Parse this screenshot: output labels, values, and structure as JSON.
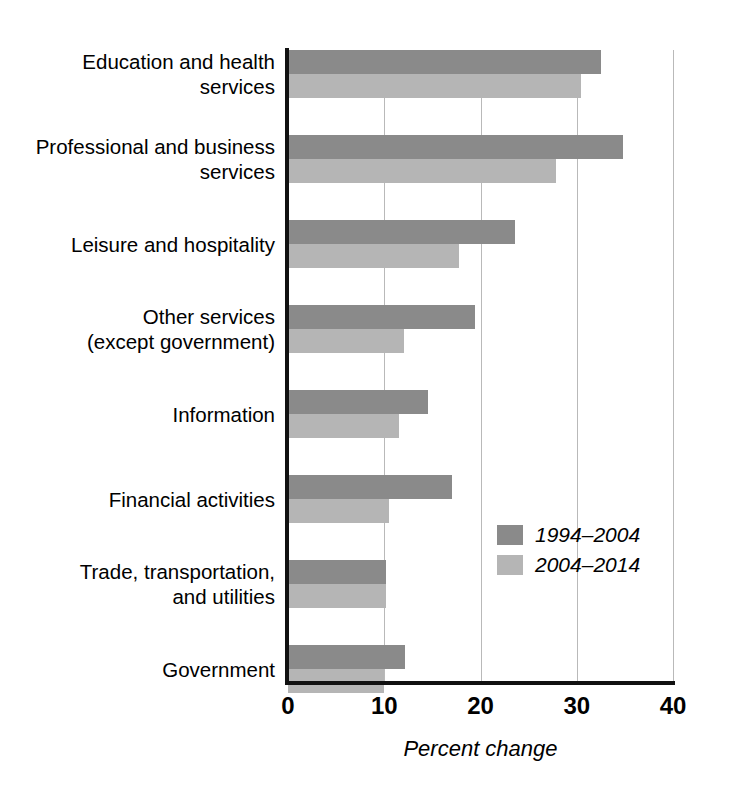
{
  "chart_data": {
    "type": "bar",
    "orientation": "horizontal",
    "title": "",
    "xlabel": "Percent change",
    "ylabel": "",
    "xlim": [
      0,
      40
    ],
    "xticks": [
      0,
      10,
      20,
      30,
      40
    ],
    "xtick_labels": [
      "0",
      "10",
      "20",
      "30",
      "40"
    ],
    "grid": "vertical",
    "legend_position": "inside-lower-right",
    "categories": [
      "Education and health services",
      "Professional and business services",
      "Leisure and hospitality",
      "Other services (except government)",
      "Information",
      "Financial activities",
      "Trade, transportation, and utilities",
      "Government"
    ],
    "category_label_lines": [
      [
        "Education and health",
        "services"
      ],
      [
        "Professional and business",
        "services"
      ],
      [
        "Leisure and hospitality"
      ],
      [
        "Other services",
        "(except government)"
      ],
      [
        "Information"
      ],
      [
        "Financial activities"
      ],
      [
        "Trade, transportation,",
        "and utilities"
      ],
      [
        "Government"
      ]
    ],
    "series": [
      {
        "name": "1994–2004",
        "color": "#8a8a8a",
        "values": [
          32.5,
          34.8,
          23.6,
          19.4,
          14.5,
          17.0,
          10.2,
          12.2
        ]
      },
      {
        "name": "2004–2014",
        "color": "#b5b5b5",
        "values": [
          30.4,
          27.8,
          17.8,
          12.0,
          11.5,
          10.5,
          10.2,
          10.0
        ]
      }
    ]
  },
  "axis": {
    "line_color": "#111111",
    "grid_color": "#b9b9b9"
  }
}
